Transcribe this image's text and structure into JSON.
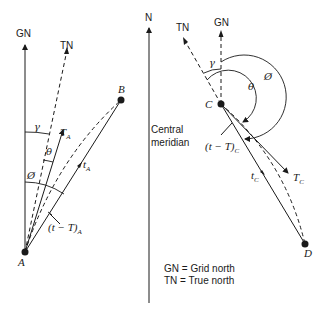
{
  "diagram": {
    "left": {
      "labels": {
        "gn": "GN",
        "tn": "TN",
        "point_a": "A",
        "point_b": "B",
        "gamma": "γ",
        "theta": "θ",
        "phi": "Ø",
        "t_big": "T",
        "t_big_sub": "A",
        "t_small": "t",
        "t_small_sub": "A",
        "correction": "(t − T)",
        "correction_sub": "A"
      }
    },
    "meridian": {
      "north": "N",
      "label_line1": "Central",
      "label_line2": "meridian"
    },
    "right": {
      "labels": {
        "gn": "GN",
        "tn": "TN",
        "point_c": "C",
        "point_d": "D",
        "gamma": "γ",
        "theta": "θ",
        "phi": "Ø",
        "t_big": "T",
        "t_big_sub": "C",
        "t_small": "t",
        "t_small_sub": "C",
        "correction": "(t − T)",
        "correction_sub": "C"
      }
    },
    "legend": {
      "line1": "GN = Grid north",
      "line2": "TN = True north"
    }
  }
}
